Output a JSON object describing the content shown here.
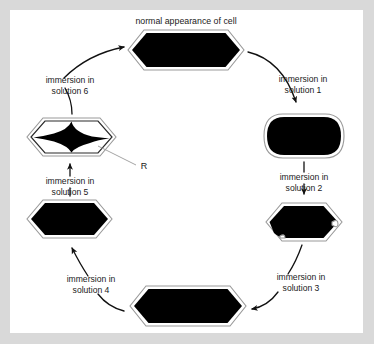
{
  "figure": {
    "title": "normal appearance of cell",
    "frame_color": "#d9d9d9",
    "panel_color": "#ffffff",
    "ink_color": "#000000",
    "membrane_color": "#9a9a9a"
  },
  "callout": {
    "label": "R"
  },
  "steps": [
    {
      "id": "solution-1",
      "line1": "immersion in",
      "line2": "solution 1"
    },
    {
      "id": "solution-2",
      "line1": "immersion in",
      "line2": "solution 2"
    },
    {
      "id": "solution-3",
      "line1": "immersion in",
      "line2": "solution 3"
    },
    {
      "id": "solution-4",
      "line1": "immersion in",
      "line2": "solution 4"
    },
    {
      "id": "solution-5",
      "line1": "immersion in",
      "line2": "solution 5"
    },
    {
      "id": "solution-6",
      "line1": "immersion in",
      "line2": "solution 6"
    }
  ],
  "cells": [
    {
      "id": "cell-normal",
      "shape": "hexagon",
      "state": "normal appearance"
    },
    {
      "id": "cell-after-solution-1",
      "shape": "rounded-swollen",
      "state": "swollen"
    },
    {
      "id": "cell-after-solution-2",
      "shape": "hexagon-irregular",
      "state": "slightly irregular"
    },
    {
      "id": "cell-after-solution-3",
      "shape": "hexagon",
      "state": "normal"
    },
    {
      "id": "cell-after-solution-4",
      "shape": "hexagon",
      "state": "normal"
    },
    {
      "id": "cell-after-solution-5",
      "shape": "hexagon-plasmolysed",
      "state": "plasmolysed, star-shaped contents"
    }
  ]
}
